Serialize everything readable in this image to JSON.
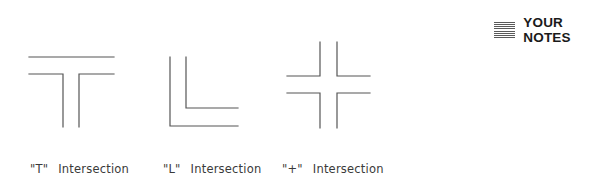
{
  "notes": {
    "icon": "notes-lines-icon",
    "label": "YOUR NOTES"
  },
  "diagrams": [
    {
      "id": "t",
      "symbol": "\"T\"",
      "label": "Intersection"
    },
    {
      "id": "l",
      "symbol": "\"L\"",
      "label": "Intersection"
    },
    {
      "id": "plus",
      "symbol": "\"+\"",
      "label": "Intersection"
    }
  ],
  "colors": {
    "line": "#555555",
    "text": "#3a3a3a",
    "heading": "#1a1a1a"
  }
}
